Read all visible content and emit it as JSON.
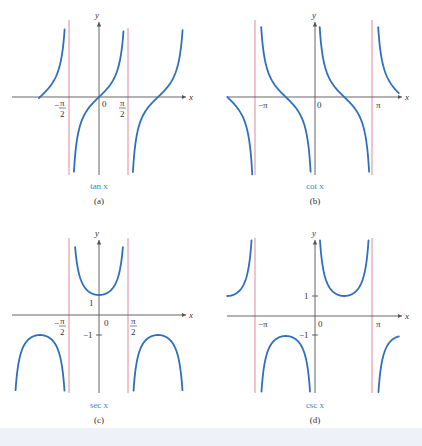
{
  "figure": {
    "panels": [
      {
        "id": "a",
        "function_label": "tan x",
        "caption": "(a)",
        "x_axis_label": "x",
        "y_axis_label": "y",
        "tick_labels": [
          "-π/2",
          "0",
          "π/2"
        ]
      },
      {
        "id": "b",
        "function_label": "cot x",
        "caption": "(b)",
        "x_axis_label": "x",
        "y_axis_label": "y",
        "tick_labels": [
          "-π",
          "0",
          "π"
        ]
      },
      {
        "id": "c",
        "function_label": "sec x",
        "caption": "(c)",
        "x_axis_label": "x",
        "y_axis_label": "y",
        "tick_labels": [
          "-π/2",
          "0",
          "π/2",
          "1",
          "-1"
        ]
      },
      {
        "id": "d",
        "function_label": "csc x",
        "caption": "(d)",
        "x_axis_label": "x",
        "y_axis_label": "y",
        "tick_labels": [
          "-π",
          "0",
          "π",
          "1",
          "-1"
        ]
      }
    ],
    "colors": {
      "curve": "#2e6fbf",
      "asymptote": "#e07a8e",
      "axis": "#555555",
      "function_label": "#3a86c8"
    }
  },
  "chart_data": [
    {
      "type": "line",
      "title": "tan x",
      "caption": "(a)",
      "xlabel": "x",
      "ylabel": "y",
      "xlim": [
        -3.3,
        4.6
      ],
      "x_ticks": [
        "-π/2",
        "0",
        "π/2"
      ],
      "asymptotes_x": [
        "-π/2",
        "π/2"
      ],
      "series": [
        {
          "name": "tan x",
          "branches": [
            [
              -4.71,
              -1.57
            ],
            [
              -1.57,
              1.57
            ],
            [
              1.57,
              4.71
            ]
          ],
          "zeros": [
            "-π",
            "0",
            "π"
          ]
        }
      ],
      "grid": false,
      "legend": "none"
    },
    {
      "type": "line",
      "title": "cot x",
      "caption": "(b)",
      "xlabel": "x",
      "ylabel": "y",
      "xlim": [
        -4.71,
        4.4
      ],
      "x_ticks": [
        "-π",
        "0",
        "π"
      ],
      "asymptotes_x": [
        "-π",
        "0",
        "π"
      ],
      "series": [
        {
          "name": "cot x",
          "branches": [
            [
              -4.71,
              -3.14
            ],
            [
              -3.14,
              0
            ],
            [
              0,
              3.14
            ],
            [
              3.14,
              4.4
            ]
          ],
          "zeros": [
            "-3π/2",
            "-π/2",
            "π/2"
          ]
        }
      ],
      "grid": false,
      "legend": "none"
    },
    {
      "type": "line",
      "title": "sec x",
      "caption": "(c)",
      "xlabel": "x",
      "ylabel": "y",
      "xlim": [
        -4.71,
        4.71
      ],
      "x_ticks": [
        "-π/2",
        "0",
        "π/2"
      ],
      "y_ticks": [
        1,
        -1
      ],
      "asymptotes_x": [
        "-π/2",
        "π/2"
      ],
      "series": [
        {
          "name": "sec x",
          "branches": [
            [
              -4.71,
              -1.57
            ],
            [
              -1.57,
              1.57
            ],
            [
              1.57,
              4.71
            ]
          ],
          "local_min": [
            0,
            1
          ],
          "local_max": [
            [
              "-π",
              -1
            ],
            [
              "π",
              -1
            ]
          ]
        }
      ],
      "grid": false,
      "legend": "none"
    },
    {
      "type": "line",
      "title": "csc x",
      "caption": "(d)",
      "xlabel": "x",
      "ylabel": "y",
      "xlim": [
        -4.71,
        4.4
      ],
      "x_ticks": [
        "-π",
        "0",
        "π"
      ],
      "y_ticks": [
        1,
        -1
      ],
      "asymptotes_x": [
        "-π",
        "0",
        "π"
      ],
      "series": [
        {
          "name": "csc x",
          "branches": [
            [
              -4.71,
              -3.14
            ],
            [
              -3.14,
              0
            ],
            [
              0,
              3.14
            ],
            [
              3.14,
              4.71
            ]
          ],
          "local_min": [
            [
              "π/2",
              1
            ],
            [
              "-3π/2",
              1
            ]
          ],
          "local_max": [
            [
              "-π/2",
              -1
            ],
            [
              "3π/2",
              -1
            ]
          ]
        }
      ],
      "grid": false,
      "legend": "none"
    }
  ]
}
